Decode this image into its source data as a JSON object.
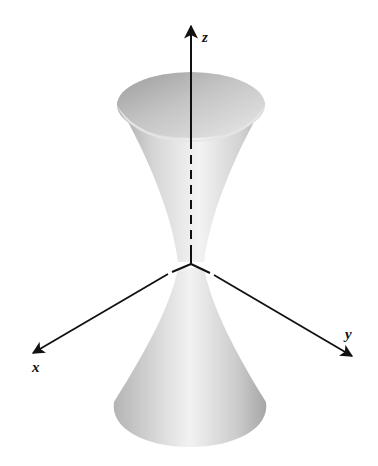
{
  "figure": {
    "axes": {
      "z_label": "z",
      "x_label": "x",
      "y_label": "y"
    },
    "colors": {
      "background": "#ffffff",
      "axis": "#111111",
      "surface_light": "#f2f2f2",
      "surface_mid": "#cfcfcf",
      "surface_dark": "#9a9a9a",
      "interior": "#b8b8b8"
    }
  }
}
